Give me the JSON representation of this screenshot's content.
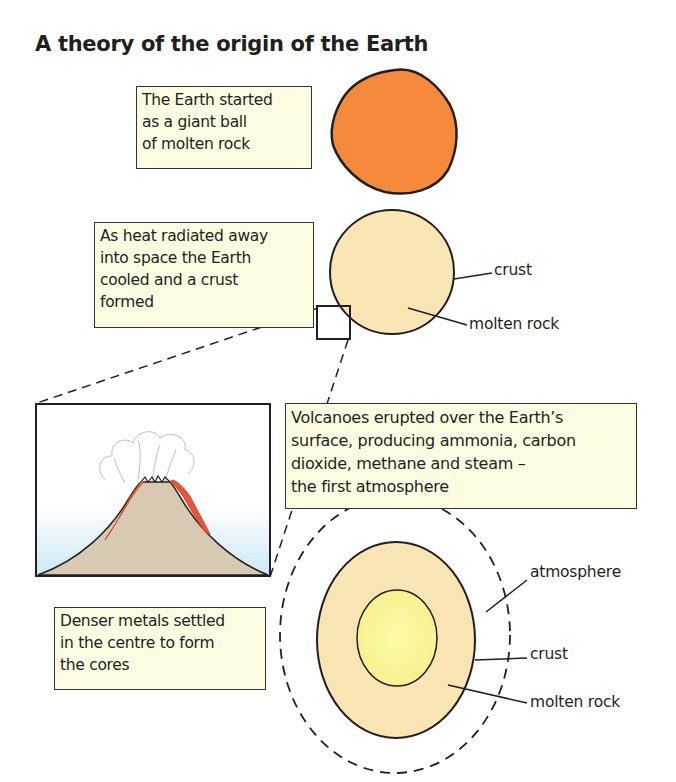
{
  "title": "A theory of the origin of the Earth",
  "stages": [
    {
      "id": "molten-ball",
      "caption": [
        "The Earth started",
        "as a giant ball",
        "of molten rock"
      ],
      "fill": "#f58a3c"
    },
    {
      "id": "crust-forms",
      "caption": [
        "As heat radiated away",
        "into space the Earth",
        "cooled and a crust",
        "formed"
      ],
      "labels": {
        "crust": "crust",
        "molten_rock": "molten rock"
      },
      "fill": "#f9e4b4"
    },
    {
      "id": "volcanoes",
      "caption": [
        "Volcanoes erupted over the Earth’s",
        "surface, producing ammonia, carbon",
        "dioxide, methane and steam –",
        "the first atmosphere"
      ],
      "colors": {
        "volcano": "#d8c9b3",
        "lava": "#e8553a",
        "sky": "#d6eef8"
      }
    },
    {
      "id": "cores-form",
      "caption": [
        "Denser metals settled",
        "in the centre to form",
        "the cores"
      ],
      "labels": {
        "atmosphere": "atmosphere",
        "crust": "crust",
        "molten_rock": "molten rock"
      },
      "fill": "#f9e4b4",
      "core_fill": "#fbf5a0"
    }
  ],
  "colors": {
    "box_bg": "#fdfce3",
    "stroke": "#231f20"
  }
}
